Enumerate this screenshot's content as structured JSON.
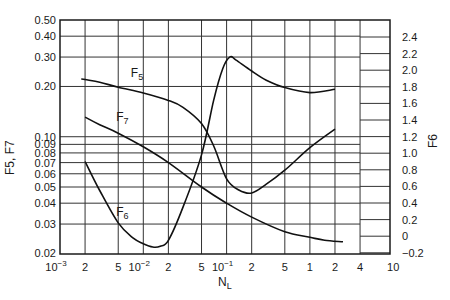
{
  "chart_data": {
    "type": "line",
    "title": "",
    "xlabel": "N_L",
    "xlabel_main": "N",
    "xlabel_sub": "L",
    "ylabel_left": "F5, F7",
    "ylabel_right": "F6",
    "xscale": "log",
    "xlim": [
      0.001,
      10
    ],
    "ylim_left": [
      0.02,
      0.5
    ],
    "yscale_left": "log",
    "ylim_right": [
      -0.2,
      2.4
    ],
    "yscale_right": "linear",
    "grid": true,
    "legend": "inline labels",
    "x_ticks": [
      {
        "value": 0.001,
        "label": "10",
        "sup": "−3"
      },
      {
        "value": 0.002,
        "label": "2"
      },
      {
        "value": 0.005,
        "label": "5"
      },
      {
        "value": 0.01,
        "label": "10",
        "sup": "−2"
      },
      {
        "value": 0.02,
        "label": "2"
      },
      {
        "value": 0.05,
        "label": "5"
      },
      {
        "value": 0.1,
        "label": "10",
        "sup": "−1"
      },
      {
        "value": 0.2,
        "label": "2"
      },
      {
        "value": 0.5,
        "label": "5"
      },
      {
        "value": 1,
        "label": "1"
      },
      {
        "value": 2,
        "label": "2"
      },
      {
        "value": 4,
        "label": "4"
      },
      {
        "value": 10,
        "label": "10"
      }
    ],
    "y_ticks_left": [
      {
        "value": 0.5,
        "label": "0.50"
      },
      {
        "value": 0.4,
        "label": "0.40"
      },
      {
        "value": 0.3,
        "label": "0.30"
      },
      {
        "value": 0.2,
        "label": "0.20"
      },
      {
        "value": 0.1,
        "label": "0.10"
      },
      {
        "value": 0.09,
        "label": "0.09"
      },
      {
        "value": 0.08,
        "label": "0.08"
      },
      {
        "value": 0.07,
        "label": "0.07"
      },
      {
        "value": 0.06,
        "label": "0.06"
      },
      {
        "value": 0.05,
        "label": "0.05"
      },
      {
        "value": 0.04,
        "label": "0.04"
      },
      {
        "value": 0.03,
        "label": "0.03"
      },
      {
        "value": 0.02,
        "label": "0.02"
      }
    ],
    "y_ticks_right": [
      {
        "value": 2.4,
        "label": "2.4"
      },
      {
        "value": 2.2,
        "label": "2.2"
      },
      {
        "value": 2.0,
        "label": "2.0"
      },
      {
        "value": 1.8,
        "label": "1.8"
      },
      {
        "value": 1.6,
        "label": "1.6"
      },
      {
        "value": 1.4,
        "label": "1.4"
      },
      {
        "value": 1.2,
        "label": "1.2"
      },
      {
        "value": 1.0,
        "label": "1.0"
      },
      {
        "value": 0.8,
        "label": "0.8"
      },
      {
        "value": 0.6,
        "label": "0.6"
      },
      {
        "value": 0.4,
        "label": "0.4"
      },
      {
        "value": 0.2,
        "label": "0.2"
      },
      {
        "value": 0,
        "label": "0"
      },
      {
        "value": -0.2,
        "label": "−0.2"
      }
    ],
    "series": [
      {
        "name": "F5",
        "label_sub": "5",
        "axis": "left",
        "x": [
          0.0018,
          0.002,
          0.003,
          0.005,
          0.01,
          0.02,
          0.03,
          0.05,
          0.07,
          0.1,
          0.14,
          0.2,
          0.3,
          0.5,
          1,
          2
        ],
        "y": [
          0.222,
          0.22,
          0.212,
          0.198,
          0.183,
          0.165,
          0.15,
          0.12,
          0.088,
          0.056,
          0.048,
          0.046,
          0.052,
          0.063,
          0.086,
          0.111
        ],
        "label_pos": [
          0.006,
          0.215
        ]
      },
      {
        "name": "F7",
        "label_sub": "7",
        "axis": "left",
        "x": [
          0.002,
          0.003,
          0.005,
          0.01,
          0.02,
          0.05,
          0.1,
          0.2,
          0.5,
          1,
          1.5,
          2.5
        ],
        "y": [
          0.131,
          0.118,
          0.105,
          0.087,
          0.07,
          0.05,
          0.04,
          0.033,
          0.027,
          0.025,
          0.024,
          0.0235
        ],
        "label_pos": [
          0.004,
          0.118
        ]
      },
      {
        "name": "F6",
        "label_sub": "6",
        "axis": "right",
        "x": [
          0.002,
          0.003,
          0.005,
          0.0075,
          0.01,
          0.013,
          0.016,
          0.02,
          0.03,
          0.05,
          0.07,
          0.09,
          0.11,
          0.13,
          0.2,
          0.3,
          0.5,
          1,
          2
        ],
        "y": [
          0.9,
          0.55,
          0.16,
          -0.02,
          -0.09,
          -0.13,
          -0.12,
          -0.05,
          0.35,
          0.98,
          1.64,
          2.02,
          2.16,
          2.12,
          1.99,
          1.88,
          1.79,
          1.73,
          1.77
        ],
        "label_pos": [
          0.004,
          0.2
        ]
      }
    ]
  }
}
